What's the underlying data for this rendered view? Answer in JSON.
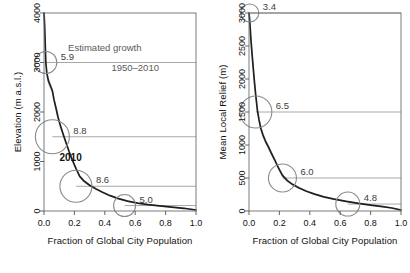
{
  "figure": {
    "background": "#ffffff",
    "axis_color": "#555555",
    "curve_color": "#1f1f1f",
    "band_color": "#b9b9b9",
    "circle_color": "#8a8a8a",
    "leader_color": "#9e9e9e",
    "label_color": "#3d3d3d"
  },
  "chart_data": [
    {
      "type": "line",
      "panel": "left",
      "title": "",
      "xlabel": "Fraction of Global City Population",
      "ylabel": "Elevation (m a.s.l.)",
      "xlim": [
        0.0,
        1.0
      ],
      "ylim": [
        0,
        4000
      ],
      "xticks": [
        "0.0",
        "0.2",
        "0.4",
        "0.6",
        "0.8",
        "1.0"
      ],
      "xtick_values": [
        0.0,
        0.2,
        0.4,
        0.6,
        0.8,
        1.0
      ],
      "yticks": [
        "0",
        "1000",
        "2000",
        "3000",
        "4000"
      ],
      "ytick_values": [
        0,
        1000,
        2000,
        3000,
        4000
      ],
      "grid": false,
      "legend": "none",
      "series": [
        {
          "name": "Elevation vs cumulative city population fraction",
          "x": [
            0.0,
            0.004,
            0.008,
            0.012,
            0.018,
            0.024,
            0.03,
            0.038,
            0.046,
            0.055,
            0.065,
            0.078,
            0.092,
            0.108,
            0.125,
            0.145,
            0.165,
            0.185,
            0.21,
            0.235,
            0.265,
            0.3,
            0.34,
            0.385,
            0.435,
            0.49,
            0.55,
            0.615,
            0.685,
            0.76,
            0.84,
            0.92,
            1.0
          ],
          "y": [
            4000,
            3760,
            3380,
            3000,
            2800,
            2700,
            2620,
            2560,
            2500,
            2430,
            2260,
            2090,
            1900,
            1720,
            1560,
            1380,
            1200,
            1040,
            860,
            700,
            600,
            520,
            450,
            380,
            310,
            250,
            200,
            160,
            130,
            105,
            80,
            55,
            20
          ]
        }
      ],
      "uncertainty_band": {
        "label": "shaded envelope",
        "upper_offset": 110,
        "lower_offset": 110
      },
      "annotations": [
        {
          "label": "5.9",
          "x": 0.012,
          "y": 3000,
          "radius_px": 11,
          "leader_to_x": 1.0
        },
        {
          "label": "8.8",
          "x": 0.055,
          "y": 1500,
          "radius_px": 17,
          "leader_to_x": 1.0
        },
        {
          "label": "8.6",
          "x": 0.21,
          "y": 500,
          "radius_px": 16,
          "leader_to_x": 1.0
        },
        {
          "label": "5.0",
          "x": 0.53,
          "y": 110,
          "radius_px": 11,
          "leader_to_x": 1.0
        }
      ],
      "text_annotations": [
        {
          "label": "Estimated growth",
          "x": 0.4,
          "y": 3230
        },
        {
          "label": "1950–2010",
          "x": 0.6,
          "y": 2830
        },
        {
          "label": "2010",
          "x": 0.175,
          "y": 1010,
          "bold": true
        }
      ]
    },
    {
      "type": "line",
      "panel": "right",
      "title": "",
      "xlabel": "Fraction of Global City Population",
      "ylabel": "Mean Local Relief (m)",
      "xlim": [
        0.0,
        1.0
      ],
      "ylim": [
        0,
        3000
      ],
      "xticks": [
        "0.0",
        "0.2",
        "0.4",
        "0.6",
        "0.8",
        "1.0"
      ],
      "xtick_values": [
        0.0,
        0.2,
        0.4,
        0.6,
        0.8,
        1.0
      ],
      "yticks": [
        "0",
        "500",
        "1000",
        "1500",
        "2000",
        "2500",
        "3000"
      ],
      "ytick_values": [
        0,
        500,
        1000,
        1500,
        2000,
        2500,
        3000
      ],
      "grid": false,
      "legend": "none",
      "series": [
        {
          "name": "Mean local relief vs cumulative city population fraction",
          "x": [
            0.0,
            0.005,
            0.012,
            0.02,
            0.028,
            0.036,
            0.045,
            0.055,
            0.066,
            0.078,
            0.092,
            0.108,
            0.126,
            0.146,
            0.168,
            0.192,
            0.22,
            0.252,
            0.288,
            0.33,
            0.378,
            0.432,
            0.492,
            0.56,
            0.64,
            0.72,
            0.8,
            0.88,
            0.94,
            1.0
          ],
          "y": [
            3000,
            2880,
            2620,
            2380,
            2160,
            1950,
            1740,
            1530,
            1380,
            1250,
            1150,
            1060,
            980,
            880,
            780,
            660,
            540,
            460,
            400,
            350,
            300,
            255,
            215,
            180,
            145,
            115,
            90,
            65,
            45,
            15
          ]
        }
      ],
      "uncertainty_band": {
        "label": "shaded envelope",
        "upper_offset": 90,
        "lower_offset": 90
      },
      "annotations": [
        {
          "label": "3.4",
          "x": 0.005,
          "y": 3000,
          "radius_px": 9,
          "leader_to_x": 1.0
        },
        {
          "label": "6.5",
          "x": 0.045,
          "y": 1500,
          "radius_px": 16,
          "leader_to_x": 1.0
        },
        {
          "label": "6.0",
          "x": 0.22,
          "y": 500,
          "radius_px": 14,
          "leader_to_x": 1.0
        },
        {
          "label": "4.8",
          "x": 0.65,
          "y": 105,
          "radius_px": 12,
          "leader_to_x": 1.0
        }
      ],
      "text_annotations": []
    }
  ]
}
